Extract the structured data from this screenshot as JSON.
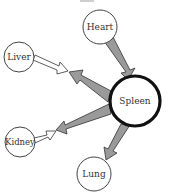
{
  "diagram": {
    "type": "organ-flow-network",
    "colors": {
      "node_stroke": "#444444",
      "node_fill": "#ffffff",
      "hub_stroke": "#111111",
      "gray_arrow_fill": "#9a9a9a",
      "white_arrow_fill": "#ffffff",
      "arrow_stroke": "#333333",
      "label": "#333333"
    },
    "nodes": [
      {
        "id": "heart",
        "label": "Heart",
        "cx": 100,
        "cy": 27,
        "r": 17
      },
      {
        "id": "liver",
        "label": "Liver",
        "cx": 19,
        "cy": 57,
        "r": 15
      },
      {
        "id": "spleen",
        "label": "Spleen",
        "cx": 135,
        "cy": 101,
        "r": 26,
        "hub": true
      },
      {
        "id": "kidney",
        "label": "Kidney",
        "cx": 20,
        "cy": 142,
        "r": 15
      },
      {
        "id": "lung",
        "label": "Lung",
        "cx": 94,
        "cy": 174,
        "r": 17
      }
    ],
    "edges": [
      {
        "from": "heart",
        "to": "spleen",
        "style": "gray"
      },
      {
        "from": "spleen",
        "to": "liver",
        "style": "gray"
      },
      {
        "from": "liver",
        "to": "spleen",
        "style": "white"
      },
      {
        "from": "spleen",
        "to": "kidney",
        "style": "gray"
      },
      {
        "from": "kidney",
        "to": "spleen",
        "style": "white"
      },
      {
        "from": "spleen",
        "to": "lung",
        "style": "gray"
      }
    ]
  }
}
